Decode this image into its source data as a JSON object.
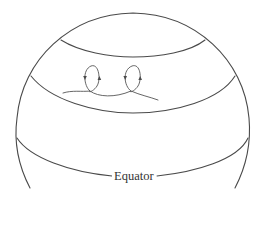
{
  "diagram": {
    "type": "globe-latitude-bands",
    "labels": {
      "equator": "Equator"
    },
    "colors": {
      "line": "#4a4a4a",
      "background": "#ffffff"
    },
    "elements": [
      {
        "name": "globe-outline",
        "description": "Outer hemisphere outline"
      },
      {
        "name": "polar-cap-boundary",
        "description": "Upper latitude line"
      },
      {
        "name": "mid-latitude-line",
        "description": "Middle latitude line"
      },
      {
        "name": "equator-line",
        "description": "Equator latitude line with label"
      },
      {
        "name": "cyclonic-loops",
        "description": "Two looping flow paths with directional arrows in the mid-latitude band"
      }
    ]
  }
}
